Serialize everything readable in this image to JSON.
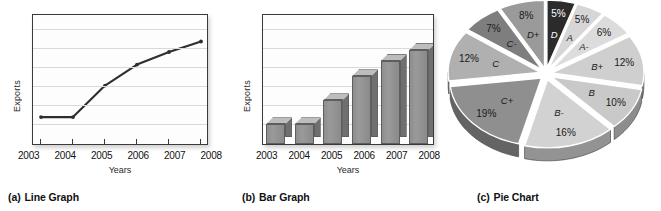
{
  "figure": {
    "panels": [
      {
        "key": "(a)",
        "title": "Line Graph"
      },
      {
        "key": "(b)",
        "title": "Bar Graph"
      },
      {
        "key": "(c)",
        "title": "Pie Chart"
      }
    ]
  },
  "chart_data": [
    {
      "type": "line",
      "title": "Line Graph",
      "xlabel": "Years",
      "ylabel": "Exports",
      "categories": [
        "2003",
        "2004",
        "2005",
        "2006",
        "2007",
        "2008"
      ],
      "x": [
        2003,
        2004,
        2005,
        2006,
        2007,
        2008
      ],
      "values": [
        18,
        18,
        48,
        68,
        80,
        90
      ],
      "ylim": [
        0,
        100
      ],
      "yticklabels": [],
      "grid": true,
      "legend": null,
      "markers": true
    },
    {
      "type": "bar",
      "title": "Bar Graph",
      "xlabel": "Years",
      "ylabel": "Exports",
      "categories": [
        "2003",
        "2004",
        "2005",
        "2006",
        "2007",
        "2008"
      ],
      "values": [
        18,
        18,
        40,
        62,
        76,
        86
      ],
      "ylim": [
        0,
        100
      ],
      "yticklabels": [],
      "grid": true,
      "legend": null,
      "style": "3d"
    },
    {
      "type": "pie",
      "title": "Pie Chart",
      "exploded": true,
      "style": "3d",
      "start_angle_deg": -90,
      "labels": [
        "D",
        "A",
        "A-",
        "B+",
        "B",
        "B-",
        "C+",
        "C",
        "C-",
        "D+"
      ],
      "values": [
        5,
        5,
        6,
        12,
        10,
        16,
        19,
        12,
        7,
        8
      ],
      "pct_labels": [
        "5%",
        "5%",
        "6%",
        "12%",
        "10%",
        "16%",
        "19%",
        "12%",
        "7%",
        "8%"
      ],
      "total": 100,
      "colors": [
        "#2b2b2b",
        "#d6d6d6",
        "#dcdcdc",
        "#cfcfcf",
        "#c9c9c9",
        "#d2d2d2",
        "#8f8f8f",
        "#b0b0b0",
        "#7e7e7e",
        "#9a9a9a"
      ]
    }
  ]
}
